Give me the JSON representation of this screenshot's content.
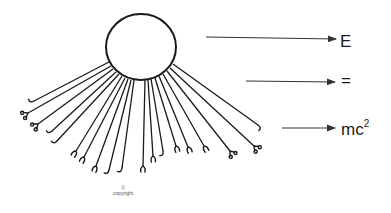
{
  "diagram": {
    "labels": {
      "e": "E",
      "equals": "=",
      "mc_base": "mc",
      "mc_exponent": "2"
    },
    "copyright": {
      "symbol": "©",
      "text": "copyright"
    },
    "colors": {
      "stroke": "#1a1a1a",
      "arrow": "#333333",
      "background": "#ffffff"
    },
    "circle": {
      "cx": 141,
      "cy": 47,
      "rx": 35,
      "ry": 33
    },
    "arrows": [
      {
        "name": "arrow-to-e",
        "x1": 206,
        "y1": 37,
        "x2": 336,
        "y2": 39
      },
      {
        "name": "arrow-to-equals",
        "x1": 246,
        "y1": 81,
        "x2": 335,
        "y2": 82
      },
      {
        "name": "arrow-to-mc2",
        "x1": 282,
        "y1": 128,
        "x2": 335,
        "y2": 128
      }
    ],
    "rays": [
      {
        "x1": 109,
        "y1": 62,
        "x2": 34,
        "y2": 101,
        "tip": "hook"
      },
      {
        "x1": 111,
        "y1": 66,
        "x2": 28,
        "y2": 113,
        "tip": "scissors"
      },
      {
        "x1": 113,
        "y1": 69,
        "x2": 38,
        "y2": 124,
        "tip": "scissors"
      },
      {
        "x1": 116,
        "y1": 72,
        "x2": 52,
        "y2": 131,
        "tip": "hook"
      },
      {
        "x1": 119,
        "y1": 74,
        "x2": 57,
        "y2": 141,
        "tip": "hook"
      },
      {
        "x1": 122,
        "y1": 76,
        "x2": 76,
        "y2": 151,
        "tip": "claw"
      },
      {
        "x1": 125,
        "y1": 78,
        "x2": 84,
        "y2": 157,
        "tip": "claw"
      },
      {
        "x1": 128,
        "y1": 79,
        "x2": 96,
        "y2": 166,
        "tip": "claw"
      },
      {
        "x1": 131,
        "y1": 80,
        "x2": 109,
        "y2": 170,
        "tip": "hook"
      },
      {
        "x1": 134,
        "y1": 80,
        "x2": 122,
        "y2": 168,
        "tip": "hook"
      },
      {
        "x1": 145,
        "y1": 80,
        "x2": 143,
        "y2": 166,
        "tip": "claw"
      },
      {
        "x1": 148,
        "y1": 80,
        "x2": 153,
        "y2": 156,
        "tip": "claw"
      },
      {
        "x1": 151,
        "y1": 79,
        "x2": 163,
        "y2": 151,
        "tip": "hook"
      },
      {
        "x1": 155,
        "y1": 78,
        "x2": 176,
        "y2": 146,
        "tip": "claw"
      },
      {
        "x1": 159,
        "y1": 76,
        "x2": 188,
        "y2": 147,
        "tip": "claw"
      },
      {
        "x1": 163,
        "y1": 74,
        "x2": 204,
        "y2": 146,
        "tip": "claw"
      },
      {
        "x1": 167,
        "y1": 71,
        "x2": 230,
        "y2": 151,
        "tip": "scissors"
      },
      {
        "x1": 170,
        "y1": 68,
        "x2": 254,
        "y2": 146,
        "tip": "scissors"
      },
      {
        "x1": 173,
        "y1": 64,
        "x2": 258,
        "y2": 125,
        "tip": "hook"
      }
    ]
  }
}
